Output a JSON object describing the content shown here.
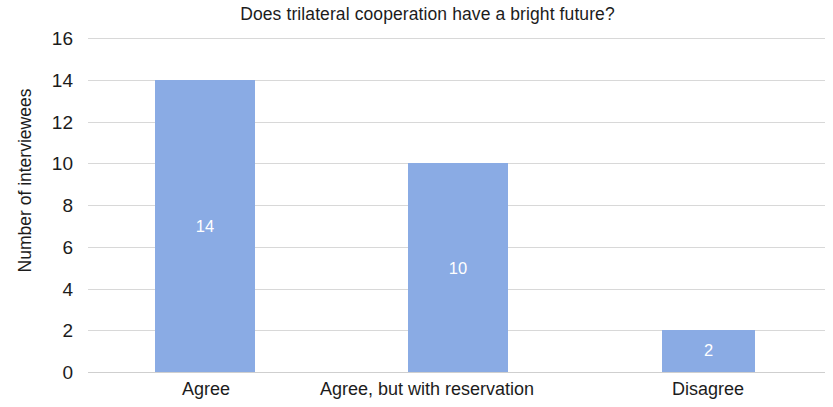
{
  "chart_data": {
    "type": "bar",
    "title": "Does trilateral cooperation have a bright future?",
    "xlabel": "",
    "ylabel": "Number of interviewees",
    "categories": [
      "Agree",
      "Agree, but with reservation",
      "Disagree"
    ],
    "values": [
      14,
      10,
      2
    ],
    "value_labels": [
      "14",
      "10",
      "2"
    ],
    "ylim": [
      0,
      16
    ],
    "ytick_labels": [
      "16",
      "14",
      "12",
      "10",
      "8",
      "6",
      "4",
      "2",
      "0"
    ],
    "ytick_values": [
      16,
      14,
      12,
      10,
      8,
      6,
      4,
      2,
      0
    ],
    "grid": true,
    "legend": "none",
    "bar_color": "#8aabe4",
    "value_label_color": "#ffffff",
    "gridline_color": "#d8d8d8",
    "background_color": "#ffffff"
  }
}
